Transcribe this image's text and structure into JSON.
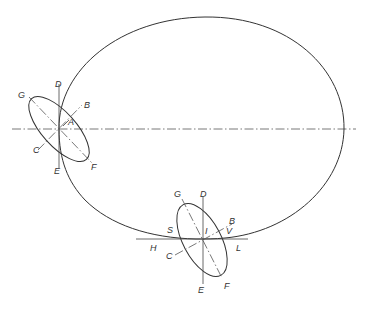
{
  "diagram": {
    "colors": {
      "line": "#333333",
      "background": "#ffffff"
    },
    "left_ellipse": {
      "labels": {
        "D": "D",
        "B": "B",
        "A": "A",
        "G": "G",
        "C": "C",
        "E": "E",
        "F": "F"
      }
    },
    "bottom_ellipse": {
      "labels": {
        "G": "G",
        "D": "D",
        "B": "B",
        "S": "S",
        "I": "I",
        "V": "V",
        "H": "H",
        "L": "L",
        "C": "C",
        "E": "E",
        "F": "F"
      }
    }
  }
}
